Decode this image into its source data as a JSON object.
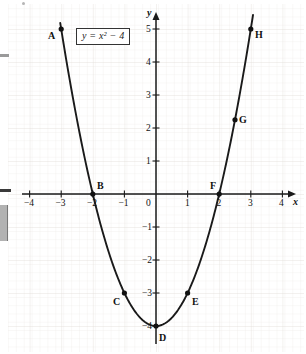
{
  "chart_data": {
    "type": "line",
    "title": "",
    "equation_label": "y = x² − 4",
    "xlabel": "x",
    "ylabel": "y",
    "xlim": [
      -4.4,
      4.4
    ],
    "ylim": [
      -4.4,
      5.4
    ],
    "xticks": [
      -4,
      -3,
      -2,
      -1,
      0,
      1,
      2,
      3,
      4
    ],
    "xtick_labels": [
      "−4",
      "−3",
      "−2",
      "−1",
      "0",
      "1",
      "2",
      "3",
      "4"
    ],
    "yticks": [
      -4,
      -3,
      -2,
      -1,
      1,
      2,
      3,
      4,
      5
    ],
    "ytick_labels": [
      "−4",
      "−3",
      "−2",
      "−1",
      "1",
      "2",
      "3",
      "4",
      "5"
    ],
    "grid": true,
    "grid_style": "faint graph paper",
    "legend": "none",
    "curve": {
      "name": "y = x² − 4",
      "x_start": -3.03,
      "x_end": 3.07,
      "color": "#1a1a1a"
    },
    "points": [
      {
        "label": "A",
        "x": -3,
        "y": 5,
        "label_pos": "left"
      },
      {
        "label": "B",
        "x": -2,
        "y": 0,
        "label_pos": "upper-right"
      },
      {
        "label": "C",
        "x": -1,
        "y": -3,
        "label_pos": "lower-left"
      },
      {
        "label": "D",
        "x": 0,
        "y": -4,
        "label_pos": "lower-right"
      },
      {
        "label": "E",
        "x": 1,
        "y": -3,
        "label_pos": "right"
      },
      {
        "label": "F",
        "x": 2,
        "y": 0,
        "label_pos": "upper-left"
      },
      {
        "label": "G",
        "x": 2.5,
        "y": 2.25,
        "label_pos": "right"
      },
      {
        "label": "H",
        "x": 3,
        "y": 5,
        "label_pos": "right"
      }
    ]
  },
  "axes": {
    "x_axis_name": "x",
    "y_axis_name": "y",
    "origin_label": "0"
  }
}
